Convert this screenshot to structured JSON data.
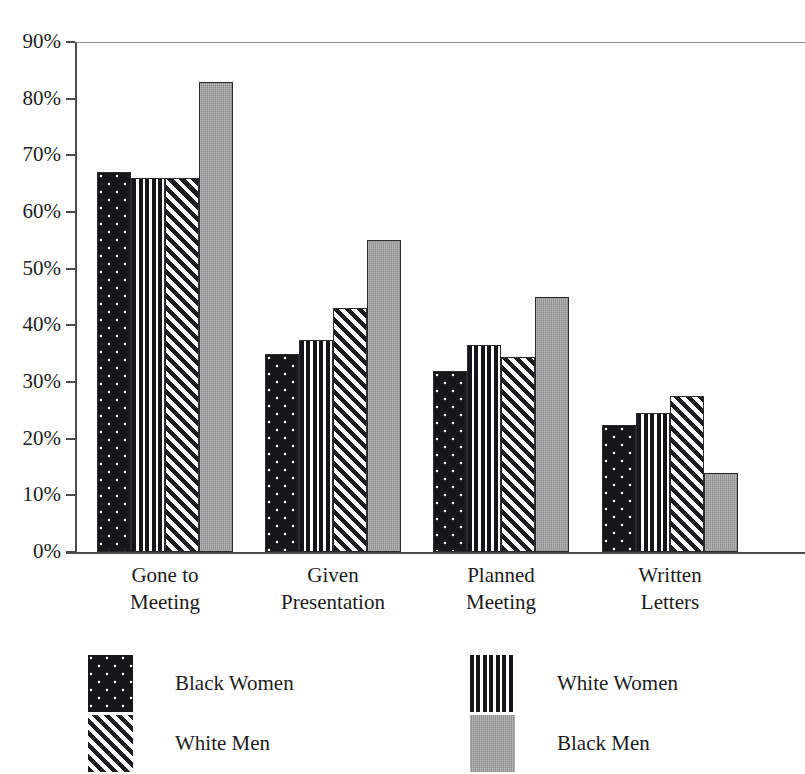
{
  "chart_data": {
    "type": "bar",
    "title": "",
    "xlabel": "",
    "ylabel": "",
    "ylim": [
      0,
      90
    ],
    "grid": false,
    "legend_position": "bottom",
    "categories": [
      "Gone to Meeting",
      "Given Presentation",
      "Planned Meeting",
      "Written Letters"
    ],
    "category_lines": [
      [
        "Gone to",
        "Meeting"
      ],
      [
        "Given",
        "Presentation"
      ],
      [
        "Planned",
        "Meeting"
      ],
      [
        "Written",
        "Letters"
      ]
    ],
    "ytick_labels": [
      "90%",
      "80%",
      "70%",
      "60%",
      "50%",
      "40%",
      "30%",
      "20%",
      "10%",
      "0%"
    ],
    "ytick_values": [
      90,
      80,
      70,
      60,
      50,
      40,
      30,
      20,
      10,
      0
    ],
    "series": [
      {
        "name": "Black Women",
        "pattern": "dots",
        "values": [
          67,
          35,
          32,
          22.5
        ]
      },
      {
        "name": "White Women",
        "pattern": "vstripe",
        "values": [
          66,
          37.5,
          36.5,
          24.5
        ]
      },
      {
        "name": "White Men",
        "pattern": "diag",
        "values": [
          66,
          43,
          34.5,
          27.5
        ]
      },
      {
        "name": "Black Men",
        "pattern": "gray",
        "values": [
          83,
          55,
          45,
          14
        ]
      }
    ]
  },
  "legend": {
    "items": [
      {
        "label": "Black Women",
        "pattern": "dots"
      },
      {
        "label": "White Women",
        "pattern": "vstripe"
      },
      {
        "label": "White Men",
        "pattern": "diag"
      },
      {
        "label": "Black Men",
        "pattern": "gray"
      }
    ]
  },
  "colors": {
    "dark": "#17171a",
    "gray": "#9a9a9a",
    "axis": "#4b4b4b",
    "text": "#1c1c1c"
  }
}
